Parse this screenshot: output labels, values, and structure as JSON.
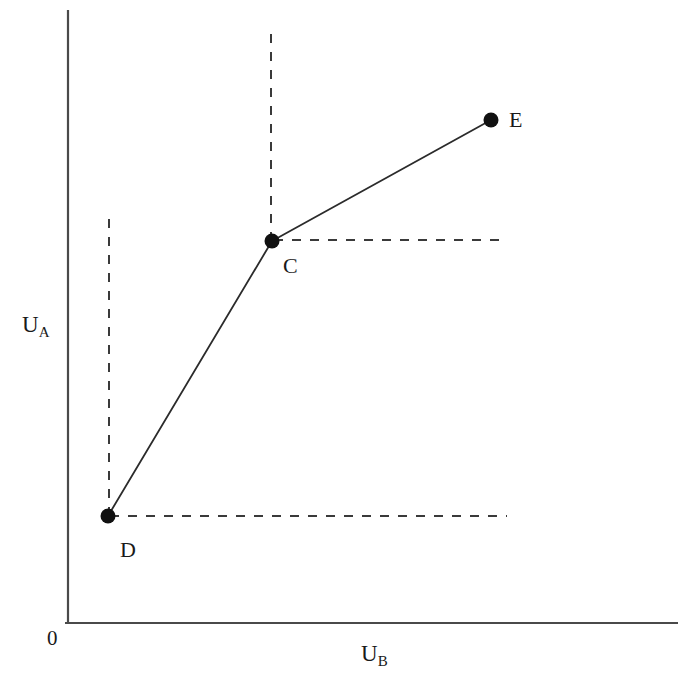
{
  "figure": {
    "background_color": "#ffffff",
    "ink_color": "#1a1a1a",
    "origin_label": "0"
  },
  "axes": {
    "y_label_main": "U",
    "y_label_sub": "A",
    "x_label_main": "U",
    "x_label_sub": "B",
    "y_axis": {
      "x": 68,
      "y_top": 10,
      "y_bottom": 623
    },
    "x_axis": {
      "y": 623,
      "x_left": 65,
      "x_right": 678
    }
  },
  "points": {
    "d": {
      "label": "D",
      "px": 108,
      "py": 516,
      "label_x": 120,
      "label_y": 539
    },
    "c": {
      "label": "C",
      "px": 272,
      "py": 241,
      "label_x": 283,
      "label_y": 255
    },
    "e": {
      "label": "E",
      "px": 491,
      "py": 120,
      "label_x": 509,
      "label_y": 109
    }
  },
  "guides": {
    "d_vertical_top_y": 218,
    "c_vertical_top_y": 30,
    "d_horizontal_right_x": 507,
    "c_horizontal_right_x": 507,
    "dash_pattern": "9 9"
  },
  "chart_data": {
    "type": "line",
    "title": "",
    "subtitle": "",
    "xlabel": "U_B",
    "ylabel": "U_A",
    "xlim": [
      0,
      100
    ],
    "ylim": [
      0,
      100
    ],
    "grid": false,
    "legend": null,
    "series": [
      {
        "name": "Utility possibility frontier",
        "style": "solid-with-markers",
        "points": [
          {
            "label": "D",
            "x": 7.0,
            "y": 17.5
          },
          {
            "label": "C",
            "x": 33.4,
            "y": 62.3
          },
          {
            "label": "E",
            "x": 69.0,
            "y": 82.0
          }
        ]
      }
    ],
    "annotations": [
      {
        "text": "D",
        "x": 7.0,
        "y": 17.5,
        "position": "below-right"
      },
      {
        "text": "C",
        "x": 33.4,
        "y": 62.3,
        "position": "below-right"
      },
      {
        "text": "E",
        "x": 69.0,
        "y": 82.0,
        "position": "right"
      }
    ],
    "guide_lines": [
      {
        "type": "vertical-dashed",
        "x": 7.0,
        "from_y": 17.5,
        "to_y": 66.0
      },
      {
        "type": "vertical-dashed",
        "x": 33.4,
        "from_y": 62.3,
        "to_y": 96.8
      },
      {
        "type": "horizontal-dashed",
        "y": 17.5,
        "from_x": 7.0,
        "to_x": 72.0
      },
      {
        "type": "horizontal-dashed",
        "y": 62.3,
        "from_x": 33.4,
        "to_x": 72.0
      }
    ]
  }
}
